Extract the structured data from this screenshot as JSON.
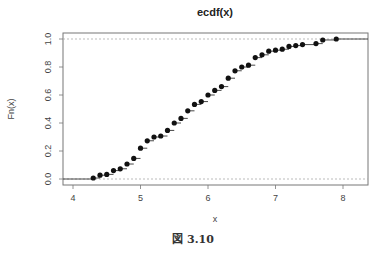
{
  "chart_data": {
    "type": "scatter",
    "subtype": "ecdf-step",
    "title": "ecdf(x)",
    "xlabel": "x",
    "ylabel": "Fn(x)",
    "xlim": [
      3.85,
      8.35
    ],
    "ylim": [
      -0.04,
      1.04
    ],
    "xticks": [
      4,
      5,
      6,
      7,
      8
    ],
    "yticks": [
      0.0,
      0.2,
      0.4,
      0.6,
      0.8,
      1.0
    ],
    "ytick_labels": [
      "0.0",
      "0.2",
      "0.4",
      "0.6",
      "0.8",
      "1.0"
    ],
    "hlines_dashed": [
      0.0,
      1.0
    ],
    "grid": false,
    "legend": null,
    "x": [
      4.3,
      4.4,
      4.5,
      4.6,
      4.7,
      4.8,
      4.9,
      5.0,
      5.1,
      5.2,
      5.3,
      5.4,
      5.5,
      5.6,
      5.7,
      5.8,
      5.9,
      6.0,
      6.1,
      6.2,
      6.3,
      6.4,
      6.5,
      6.6,
      6.7,
      6.8,
      6.9,
      7.0,
      7.1,
      7.2,
      7.3,
      7.4,
      7.6,
      7.7,
      7.9
    ],
    "y": [
      0.007,
      0.027,
      0.033,
      0.06,
      0.073,
      0.107,
      0.147,
      0.22,
      0.273,
      0.3,
      0.307,
      0.347,
      0.4,
      0.433,
      0.487,
      0.533,
      0.553,
      0.6,
      0.633,
      0.66,
      0.72,
      0.773,
      0.8,
      0.813,
      0.867,
      0.887,
      0.913,
      0.92,
      0.927,
      0.947,
      0.953,
      0.96,
      0.967,
      0.993,
      1.0
    ]
  },
  "caption": "図 3.10"
}
